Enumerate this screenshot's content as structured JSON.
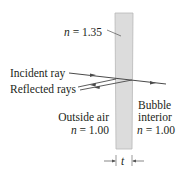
{
  "diagram": {
    "film": {
      "label_n": "n",
      "label_value": "= 1.35",
      "fill_color": "#dcdcdc",
      "edge_color": "#b8b8b8"
    },
    "labels": {
      "incident": "Incident ray",
      "reflected": "Reflected rays",
      "outside_line1": "Outside air",
      "outside_n": "n",
      "outside_value": "= 1.00",
      "interior_line1": "Bubble",
      "interior_line2": "interior",
      "interior_n": "n",
      "interior_value": "= 1.00",
      "thickness": "t"
    },
    "ray_color": "#4a4a4a"
  }
}
